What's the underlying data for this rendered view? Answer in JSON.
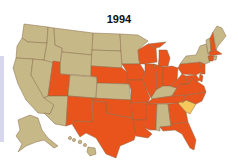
{
  "title": "1994",
  "colors": {
    "base": "#c6b887",
    "highlight": "#e9531c",
    "special": "#f6c75a",
    "border": "#8a6a4a",
    "strip": "#d8d6ee"
  },
  "map": {
    "highlighted_states": [
      "Utah",
      "New Mexico",
      "Texas",
      "Oklahoma",
      "Nebraska",
      "Iowa",
      "Missouri",
      "Arkansas",
      "Louisiana",
      "Mississippi",
      "Illinois",
      "Indiana",
      "Ohio",
      "Michigan",
      "Wisconsin",
      "Tennessee",
      "Georgia",
      "Florida",
      "North Carolina",
      "Virginia",
      "West Virginia",
      "Pennsylvania",
      "New Hampshire",
      "Massachusetts",
      "Connecticut",
      "New Jersey",
      "Delaware",
      "Maryland"
    ],
    "special_states": [
      "South Carolina"
    ],
    "base_states": [
      "Washington",
      "Oregon",
      "California",
      "Nevada",
      "Idaho",
      "Montana",
      "Wyoming",
      "Colorado",
      "Arizona",
      "North Dakota",
      "South Dakota",
      "Kansas",
      "Minnesota",
      "Kentucky",
      "Alabama",
      "New York",
      "Vermont",
      "Maine",
      "Alaska",
      "Hawaii"
    ]
  }
}
